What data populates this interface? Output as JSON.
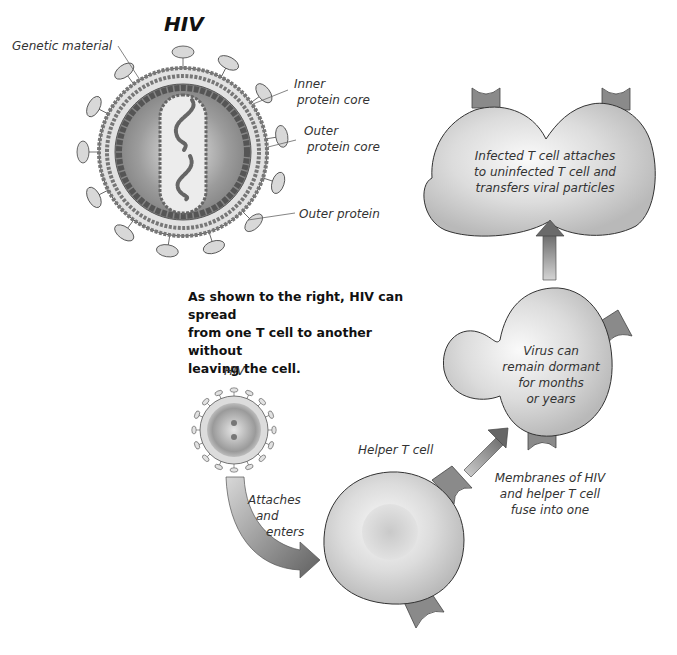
{
  "diagram": {
    "title": "HIV",
    "virion_labels": {
      "genetic_material": "Genetic material",
      "inner_core_1": "Inner",
      "inner_core_2": "protein core",
      "outer_core_1": "Outer",
      "outer_core_2": "protein core",
      "outer_protein": "Outer protein"
    },
    "explanation": [
      "As shown to the right, HIV can spread",
      "from one T cell to another without",
      "leaving the cell."
    ],
    "small_hiv_label": "HIV",
    "attach_label": [
      "Attaches",
      "and",
      "enters"
    ],
    "helper_label": "Helper T cell",
    "fuse_label": [
      "Membranes of HIV",
      "and helper T cell",
      "fuse into one"
    ],
    "dormant_label": [
      "Virus can",
      "remain dormant",
      "for months",
      "or years"
    ],
    "transfer_label": [
      "Infected T cell attaches",
      "to uninfected T cell and",
      "transfers viral particles"
    ],
    "colors": {
      "cell_fill": "#d4d4d4",
      "receptor": "#8a8a8a",
      "arrow_dark": "#6e6e6e",
      "arrow_light": "#c8c8c8",
      "outline": "#333333"
    }
  }
}
